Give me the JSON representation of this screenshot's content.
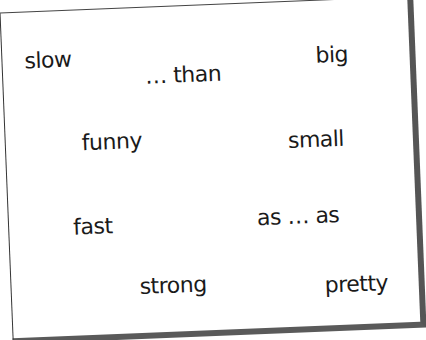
{
  "card": {
    "words": [
      {
        "text": "slow",
        "x": 28,
        "y": 40
      },
      {
        "text": "… than",
        "x": 148,
        "y": 64
      },
      {
        "text": "big",
        "x": 322,
        "y": 42
      },
      {
        "text": "funny",
        "x": 78,
        "y": 124
      },
      {
        "text": "small",
        "x": 284,
        "y": 124
      },
      {
        "text": "fast",
        "x": 62,
        "y": 204
      },
      {
        "text": "as … as",
        "x": 248,
        "y": 196
      },
      {
        "text": "strong",
        "x": 126,
        "y": 268
      },
      {
        "text": "pretty",
        "x": 310,
        "y": 266
      }
    ]
  }
}
